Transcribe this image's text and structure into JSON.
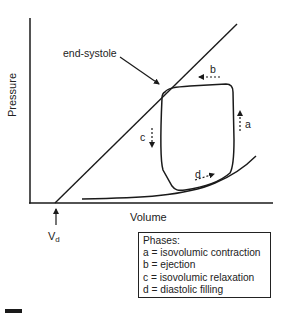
{
  "diagram": {
    "type": "pressure-volume loop",
    "axes": {
      "y_label": "Pressure",
      "x_label": "Volume"
    },
    "annotations": {
      "end_systole": "end-systole",
      "vd_main": "V",
      "vd_sub": "d",
      "phase_a": "a",
      "phase_b": "b",
      "phase_c": "c",
      "phase_d": "d"
    },
    "legend": {
      "title": "Phases:",
      "items": [
        "a = isovolumic contraction",
        "b = ejection",
        "c = isovolumic relaxation",
        "d = diastolic filling"
      ]
    },
    "colors": {
      "line": "#1a1a1a",
      "background": "#ffffff"
    }
  }
}
